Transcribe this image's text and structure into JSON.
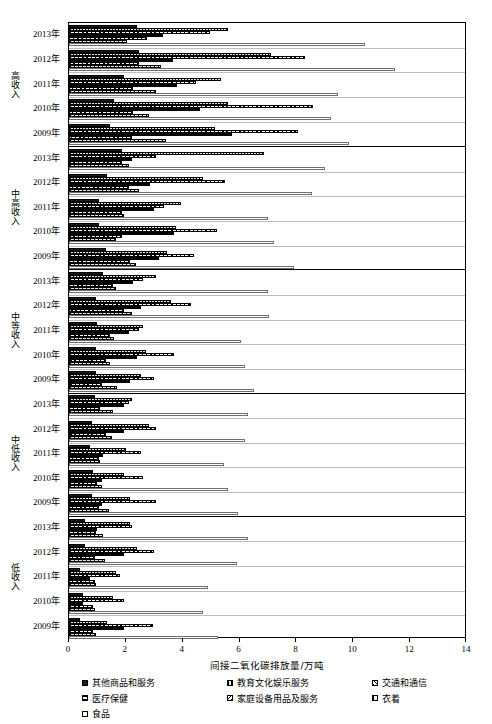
{
  "chart_data": {
    "type": "bar",
    "orientation": "horizontal",
    "title": "",
    "xlabel": "间接二氧化碳排放量/万吨",
    "ylabel": "",
    "xlim": [
      0,
      14
    ],
    "xticks": [
      0,
      2,
      4,
      6,
      8,
      10,
      12,
      14
    ],
    "xtick_labels": [
      "0",
      "2",
      "4",
      "6",
      "8",
      "10",
      "12",
      "14"
    ],
    "grid": false,
    "legend_position": "bottom",
    "series": [
      {
        "name": "其他商品和服务",
        "pattern": "solid-black"
      },
      {
        "name": "教育文化娱乐服务",
        "pattern": "fine-vertical"
      },
      {
        "name": "交通和通信",
        "pattern": "diagonal-up"
      },
      {
        "name": "医疗保健",
        "pattern": "horizontal"
      },
      {
        "name": "家庭设备用品及服务",
        "pattern": "diagonal-down"
      },
      {
        "name": "衣着",
        "pattern": "coarse-vertical"
      },
      {
        "name": "食品",
        "pattern": "empty-white"
      }
    ],
    "groups": [
      {
        "label": "高收入",
        "years": [
          {
            "year": "2013年",
            "values": [
              2.4,
              5.6,
              4.95,
              3.3,
              2.75,
              2.05,
              10.4
            ]
          },
          {
            "year": "2012年",
            "values": [
              2.45,
              7.1,
              8.3,
              3.65,
              2.45,
              3.25,
              11.45
            ]
          },
          {
            "year": "2011年",
            "values": [
              1.95,
              5.35,
              4.45,
              3.8,
              2.25,
              3.05,
              9.45
            ]
          },
          {
            "year": "2010年",
            "values": [
              1.6,
              5.6,
              8.6,
              4.6,
              2.25,
              2.8,
              9.2
            ]
          },
          {
            "year": "2009年",
            "values": [
              1.45,
              5.15,
              8.05,
              5.75,
              2.2,
              3.4,
              9.85
            ]
          }
        ]
      },
      {
        "label": "中高收入",
        "years": [
          {
            "year": "2013年",
            "values": [
              1.85,
              6.85,
              3.05,
              2.2,
              1.85,
              2.1,
              9.0
            ]
          },
          {
            "year": "2012年",
            "values": [
              1.35,
              4.7,
              5.5,
              2.85,
              2.1,
              2.45,
              8.55
            ]
          },
          {
            "year": "2011年",
            "values": [
              1.05,
              3.95,
              3.35,
              3.0,
              1.85,
              1.95,
              7.0
            ]
          },
          {
            "year": "2010年",
            "values": [
              1.05,
              3.75,
              5.2,
              3.7,
              1.85,
              1.65,
              7.2
            ]
          },
          {
            "year": "2009年",
            "values": [
              1.3,
              3.45,
              4.4,
              3.15,
              2.15,
              2.35,
              7.9
            ]
          }
        ]
      },
      {
        "label": "中等收入",
        "years": [
          {
            "year": "2013年",
            "values": [
              1.2,
              3.05,
              2.6,
              2.25,
              1.55,
              1.65,
              7.0
            ]
          },
          {
            "year": "2012年",
            "values": [
              0.95,
              3.6,
              4.3,
              2.55,
              1.95,
              2.2,
              7.05
            ]
          },
          {
            "year": "2011年",
            "values": [
              1.0,
              2.6,
              2.45,
              2.1,
              1.45,
              1.6,
              6.05
            ]
          },
          {
            "year": "2010年",
            "values": [
              0.95,
              2.7,
              3.7,
              2.4,
              1.3,
              1.45,
              6.2
            ]
          },
          {
            "year": "2009年",
            "values": [
              0.95,
              2.55,
              3.0,
              2.15,
              1.15,
              1.7,
              6.5
            ]
          }
        ]
      },
      {
        "label": "中低收入",
        "years": [
          {
            "year": "2013年",
            "values": [
              0.9,
              2.2,
              2.1,
              1.95,
              1.1,
              1.55,
              6.3
            ]
          },
          {
            "year": "2012年",
            "values": [
              0.8,
              2.8,
              3.05,
              1.95,
              1.3,
              1.5,
              6.2
            ]
          },
          {
            "year": "2011年",
            "values": [
              0.75,
              2.0,
              2.55,
              1.2,
              1.05,
              1.1,
              5.45
            ]
          },
          {
            "year": "2010年",
            "values": [
              0.85,
              1.95,
              2.6,
              1.15,
              1.0,
              1.15,
              5.6
            ]
          },
          {
            "year": "2009年",
            "values": [
              0.8,
              2.15,
              3.05,
              1.15,
              1.05,
              1.4,
              5.95
            ]
          }
        ]
      },
      {
        "label": "低收入",
        "years": [
          {
            "year": "2013年",
            "values": [
              0.55,
              2.15,
              2.2,
              1.0,
              0.95,
              1.2,
              6.3
            ]
          },
          {
            "year": "2012年",
            "values": [
              0.55,
              2.4,
              3.0,
              1.95,
              0.9,
              1.25,
              5.9
            ]
          },
          {
            "year": "2011年",
            "values": [
              0.4,
              1.65,
              1.8,
              0.75,
              0.9,
              0.95,
              4.9
            ]
          },
          {
            "year": "2010年",
            "values": [
              0.5,
              1.55,
              1.95,
              0.5,
              0.85,
              0.9,
              4.7
            ]
          },
          {
            "year": "2009年",
            "values": [
              0.4,
              1.35,
              2.95,
              1.95,
              0.85,
              0.95,
              5.25
            ]
          }
        ]
      }
    ]
  },
  "legend": {
    "rows": [
      [
        {
          "label": "其他商品和服务",
          "pattern": 0
        },
        {
          "label": "教育文化娱乐服务",
          "pattern": 1
        },
        {
          "label": "交通和通信",
          "pattern": 2
        }
      ],
      [
        {
          "label": "医疗保健",
          "pattern": 3
        },
        {
          "label": "家庭设备用品及服务",
          "pattern": 4
        },
        {
          "label": "衣着",
          "pattern": 5
        }
      ],
      [
        {
          "label": "食品",
          "pattern": 6
        }
      ]
    ]
  }
}
